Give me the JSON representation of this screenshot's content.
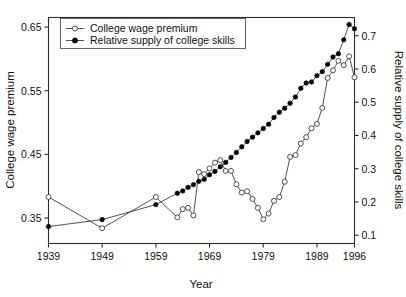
{
  "chart_data": {
    "type": "line",
    "title": "",
    "xlabel": "Year",
    "ylabel": "College wage premium",
    "y2label": "Relative supply of college skills",
    "grid": false,
    "legend_position": "top-left",
    "xlim": [
      1939,
      1996
    ],
    "ylim": [
      0.31,
      0.665
    ],
    "y2lim": [
      0.075,
      0.755
    ],
    "xticks": [
      1939,
      1949,
      1959,
      1969,
      1979,
      1989,
      1996
    ],
    "xtick_labels": [
      "1939",
      "1949",
      "1959",
      "1969",
      "1979",
      "1989",
      "1996"
    ],
    "yticks": [
      0.35,
      0.45,
      0.55,
      0.65
    ],
    "ytick_labels": [
      "0.35",
      "0.45",
      "0.55",
      "0.65"
    ],
    "y2ticks": [
      0.1,
      0.2,
      0.3,
      0.4,
      0.5,
      0.6,
      0.7
    ],
    "y2tick_labels": [
      "0.1",
      "0.2",
      "0.3",
      "0.4",
      "0.5",
      "0.6",
      "0.7"
    ],
    "series": [
      {
        "name": "College wage premium",
        "axis": "left",
        "marker": "open-circle",
        "points": [
          [
            1939,
            0.383
          ],
          [
            1949,
            0.334
          ],
          [
            1959,
            0.383
          ],
          [
            1963,
            0.351
          ],
          [
            1964,
            0.364
          ],
          [
            1965,
            0.366
          ],
          [
            1966,
            0.354
          ],
          [
            1967,
            0.422
          ],
          [
            1968,
            0.419
          ],
          [
            1969,
            0.428
          ],
          [
            1970,
            0.437
          ],
          [
            1971,
            0.441
          ],
          [
            1972,
            0.424
          ],
          [
            1973,
            0.424
          ],
          [
            1974,
            0.403
          ],
          [
            1975,
            0.39
          ],
          [
            1976,
            0.392
          ],
          [
            1977,
            0.38
          ],
          [
            1978,
            0.366
          ],
          [
            1979,
            0.348
          ],
          [
            1980,
            0.357
          ],
          [
            1981,
            0.377
          ],
          [
            1982,
            0.383
          ],
          [
            1983,
            0.407
          ],
          [
            1984,
            0.446
          ],
          [
            1985,
            0.449
          ],
          [
            1986,
            0.467
          ],
          [
            1987,
            0.477
          ],
          [
            1988,
            0.491
          ],
          [
            1989,
            0.498
          ],
          [
            1990,
            0.523
          ],
          [
            1991,
            0.57
          ],
          [
            1992,
            0.582
          ],
          [
            1993,
            0.597
          ],
          [
            1994,
            0.59
          ],
          [
            1995,
            0.604
          ],
          [
            1996,
            0.571
          ]
        ]
      },
      {
        "name": "Relative supply of college skills",
        "axis": "right",
        "marker": "filled-circle",
        "points": [
          [
            1939,
            0.126
          ],
          [
            1949,
            0.147
          ],
          [
            1959,
            0.192
          ],
          [
            1963,
            0.226
          ],
          [
            1964,
            0.233
          ],
          [
            1965,
            0.244
          ],
          [
            1966,
            0.252
          ],
          [
            1967,
            0.262
          ],
          [
            1968,
            0.268
          ],
          [
            1969,
            0.282
          ],
          [
            1970,
            0.292
          ],
          [
            1971,
            0.306
          ],
          [
            1972,
            0.319
          ],
          [
            1973,
            0.334
          ],
          [
            1974,
            0.349
          ],
          [
            1975,
            0.366
          ],
          [
            1976,
            0.382
          ],
          [
            1977,
            0.395
          ],
          [
            1978,
            0.408
          ],
          [
            1979,
            0.421
          ],
          [
            1980,
            0.434
          ],
          [
            1981,
            0.454
          ],
          [
            1982,
            0.47
          ],
          [
            1983,
            0.482
          ],
          [
            1984,
            0.497
          ],
          [
            1985,
            0.516
          ],
          [
            1986,
            0.542
          ],
          [
            1987,
            0.558
          ],
          [
            1988,
            0.561
          ],
          [
            1989,
            0.58
          ],
          [
            1990,
            0.592
          ],
          [
            1991,
            0.614
          ],
          [
            1992,
            0.636
          ],
          [
            1993,
            0.646
          ],
          [
            1994,
            0.688
          ],
          [
            1995,
            0.734
          ],
          [
            1996,
            0.721
          ]
        ]
      }
    ]
  },
  "legend": {
    "entries": [
      {
        "label": "College wage premium",
        "marker": "open-circle"
      },
      {
        "label": "Relative supply of college skills",
        "marker": "filled-circle"
      }
    ]
  }
}
